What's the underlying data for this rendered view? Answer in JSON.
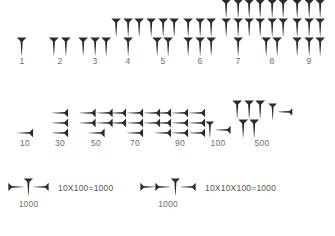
{
  "figure": {
    "background_color": "#ffffff",
    "glyph_color": "#2b2b2b",
    "label_color": "#6d6d6d"
  },
  "rows": [
    {
      "name": "units",
      "cells": [
        {
          "label": "1",
          "x": 22,
          "layout": [
            1
          ],
          "glyph": "vertical-wedge"
        },
        {
          "label": "2",
          "x": 60,
          "layout": [
            2
          ],
          "glyph": "vertical-wedge"
        },
        {
          "label": "3",
          "x": 95,
          "layout": [
            3
          ],
          "glyph": "vertical-wedge"
        },
        {
          "label": "4",
          "x": 128,
          "layout": [
            3,
            1
          ],
          "glyph": "vertical-wedge"
        },
        {
          "label": "5",
          "x": 163,
          "layout": [
            3,
            2
          ],
          "glyph": "vertical-wedge"
        },
        {
          "label": "6",
          "x": 200,
          "layout": [
            3,
            3
          ],
          "glyph": "vertical-wedge"
        },
        {
          "label": "7",
          "x": 238,
          "layout": [
            3,
            3,
            1
          ],
          "glyph": "vertical-wedge"
        },
        {
          "label": "8",
          "x": 272,
          "layout": [
            3,
            3,
            2
          ],
          "glyph": "vertical-wedge"
        },
        {
          "label": "9",
          "x": 309,
          "layout": [
            3,
            3,
            3
          ],
          "glyph": "vertical-wedge"
        }
      ]
    },
    {
      "name": "tens",
      "cells": [
        {
          "label": "10",
          "x": 25,
          "layout": [
            1
          ],
          "glyph": "horizontal-wedge"
        },
        {
          "label": "30",
          "x": 60,
          "layout": [
            1,
            1,
            1
          ],
          "glyph": "horizontal-wedge"
        },
        {
          "label": "50",
          "x": 96,
          "layout": [
            2,
            2,
            1
          ],
          "glyph": "horizontal-wedge"
        },
        {
          "label": "70",
          "x": 135,
          "layout": [
            3,
            3,
            1
          ],
          "glyph": "horizontal-wedge"
        },
        {
          "label": "90",
          "x": 180,
          "layout": [
            3,
            3,
            3
          ],
          "glyph": "horizontal-wedge"
        },
        {
          "label": "100",
          "x": 218,
          "layout": [
            1
          ],
          "glyph": "hundred"
        },
        {
          "label": "500",
          "x": 262,
          "layout": [
            3,
            2
          ],
          "glyph": "five-hundred"
        }
      ]
    }
  ],
  "thousands": [
    {
      "name": "one-thousand-simple",
      "x": 8,
      "glyph": "left-wedge vertical-wedge right-wedge",
      "left_wedges": 1,
      "caption": "1000",
      "equation": "10X100=1000"
    },
    {
      "name": "one-thousand-expanded",
      "x": 140,
      "glyph": "left-wedge left-wedge vertical-wedge right-wedge",
      "left_wedges": 2,
      "caption": "1000",
      "equation": "10X10X100=1000"
    }
  ]
}
